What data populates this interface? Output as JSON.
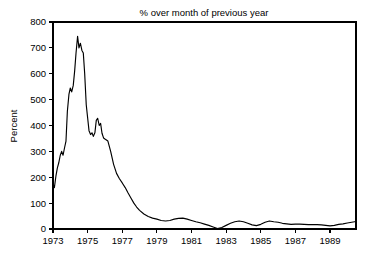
{
  "chart_data": {
    "type": "line",
    "title": "% over month of previous year",
    "xlabel": "",
    "ylabel": "Percent",
    "xlim": [
      1973.0,
      1990.5
    ],
    "ylim": [
      0,
      800
    ],
    "yticks": [
      0,
      100,
      200,
      300,
      400,
      500,
      600,
      700,
      800
    ],
    "ytick_labels": [
      "0",
      "100",
      "200",
      "300",
      "400",
      "500",
      "600",
      "700",
      "800"
    ],
    "xticks": [
      1973,
      1975,
      1977,
      1979,
      1981,
      1983,
      1985,
      1987,
      1989
    ],
    "xtick_labels": [
      "1973",
      "1975",
      "1977",
      "1979",
      "1981",
      "1983",
      "1985",
      "1987",
      "1989"
    ],
    "grid": false,
    "legend": false,
    "line_color": "#000000",
    "background_color": "#ffffff",
    "series": [
      {
        "name": "% over month of previous year",
        "x": [
          1973.0,
          1973.08,
          1973.17,
          1973.25,
          1973.33,
          1973.42,
          1973.5,
          1973.58,
          1973.67,
          1973.75,
          1973.83,
          1973.92,
          1974.0,
          1974.08,
          1974.17,
          1974.25,
          1974.33,
          1974.42,
          1974.5,
          1974.58,
          1974.67,
          1974.75,
          1974.83,
          1974.92,
          1975.0,
          1975.08,
          1975.17,
          1975.25,
          1975.33,
          1975.42,
          1975.5,
          1975.58,
          1975.67,
          1975.75,
          1975.83,
          1975.92,
          1976.0,
          1976.17,
          1976.33,
          1976.5,
          1976.67,
          1976.83,
          1977.0,
          1977.17,
          1977.33,
          1977.5,
          1977.67,
          1977.83,
          1978.0,
          1978.25,
          1978.5,
          1978.75,
          1979.0,
          1979.25,
          1979.5,
          1979.75,
          1980.0,
          1980.25,
          1980.5,
          1980.75,
          1981.0,
          1981.25,
          1981.5,
          1981.75,
          1982.0,
          1982.25,
          1982.5,
          1982.75,
          1983.0,
          1983.25,
          1983.5,
          1983.75,
          1984.0,
          1984.25,
          1984.5,
          1984.75,
          1985.0,
          1985.25,
          1985.5,
          1985.75,
          1986.0,
          1986.25,
          1986.5,
          1986.75,
          1987.0,
          1987.25,
          1987.5,
          1987.75,
          1988.0,
          1988.25,
          1988.5,
          1988.75,
          1989.0,
          1989.25,
          1989.5,
          1989.75,
          1990.0,
          1990.25,
          1990.5
        ],
        "y": [
          175,
          160,
          205,
          235,
          255,
          285,
          300,
          285,
          315,
          340,
          455,
          520,
          545,
          530,
          555,
          610,
          680,
          745,
          700,
          718,
          690,
          680,
          600,
          480,
          430,
          380,
          365,
          372,
          358,
          372,
          420,
          428,
          400,
          408,
          370,
          352,
          348,
          340,
          300,
          250,
          215,
          195,
          178,
          160,
          140,
          120,
          100,
          85,
          72,
          58,
          48,
          42,
          38,
          33,
          31,
          33,
          38,
          41,
          42,
          38,
          33,
          28,
          24,
          19,
          14,
          8,
          2,
          6,
          14,
          22,
          28,
          31,
          28,
          22,
          16,
          13,
          18,
          26,
          31,
          28,
          26,
          22,
          20,
          18,
          19,
          19,
          18,
          17,
          17,
          17,
          16,
          14,
          12,
          14,
          18,
          20,
          23,
          26,
          29
        ]
      }
    ]
  },
  "annotations": {
    "peak_value": 745,
    "peak_year": 1974,
    "trough_value": 2,
    "trough_year": 1982
  }
}
